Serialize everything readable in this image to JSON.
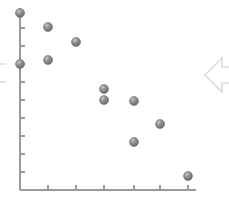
{
  "canvas": {
    "width": 229,
    "height": 205,
    "background": "#ffffff"
  },
  "chart_data": {
    "type": "scatter",
    "title": "",
    "subtitle": "",
    "xlabel": "",
    "ylabel": "",
    "legend": [],
    "legend_position": "none",
    "grid": false,
    "xlim": [
      0,
      7
    ],
    "ylim": [
      0,
      10
    ],
    "xticks": [
      0,
      1,
      2,
      3,
      4,
      5,
      6,
      7
    ],
    "xticklabels": [
      "",
      "",
      "",
      "",
      "",
      "",
      "",
      ""
    ],
    "yticks": [
      0,
      1,
      2,
      3,
      4,
      5,
      6,
      7,
      8,
      9,
      10
    ],
    "yticklabels": [
      "",
      "",
      "",
      "",
      "",
      "",
      "",
      "",
      "",
      "",
      ""
    ],
    "marker": {
      "style": "sphere",
      "color": "#808080",
      "highlight_color": "#c8c8c8",
      "edge_color": "#6e6e6e",
      "size_px": 9
    },
    "series": [
      {
        "name": "series-1",
        "x": [
          0.0,
          0.99,
          1.99,
          0.99,
          0.0,
          2.98,
          2.98,
          4.04,
          4.04,
          4.96,
          5.95
        ],
        "y": [
          9.72,
          9.06,
          8.35,
          7.49,
          7.3,
          5.94,
          5.44,
          5.39,
          3.44,
          4.38,
          1.94
        ],
        "points_px": [
          {
            "px": 20,
            "py": 13
          },
          {
            "px": 48,
            "py": 27
          },
          {
            "px": 76,
            "py": 42
          },
          {
            "px": 48,
            "py": 60
          },
          {
            "px": 20,
            "py": 64
          },
          {
            "px": 104,
            "py": 89
          },
          {
            "px": 104,
            "py": 100
          },
          {
            "px": 134,
            "py": 101
          },
          {
            "px": 134,
            "py": 142
          },
          {
            "px": 160,
            "py": 124
          },
          {
            "px": 188,
            "py": 176
          }
        ]
      }
    ],
    "axes_px": {
      "y_axis_x": 20,
      "y_axis_top": 8,
      "y_axis_bottom": 190,
      "x_axis_y": 190,
      "x_axis_left": 20,
      "x_axis_right": 196,
      "axis_color": "#9a9a9a",
      "x_tick_px": [
        48,
        76,
        104,
        134,
        160,
        188
      ],
      "y_tick_px": [
        28,
        46,
        64,
        82,
        100,
        118,
        136,
        154,
        172
      ],
      "tick_length": 5
    }
  },
  "decorations": {
    "right_arrow": {
      "name": "left-pointing-arrow",
      "color": "#dcdcdc",
      "x": 205,
      "y": 58,
      "width": 30,
      "height": 34
    },
    "left_bracket": {
      "name": "clipped-bracket",
      "color": "#dcdcdc",
      "x": -8,
      "y": 64,
      "width": 14,
      "height": 18
    }
  }
}
